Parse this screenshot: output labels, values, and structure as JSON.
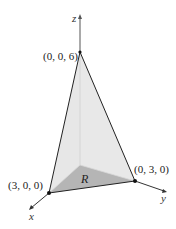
{
  "diagram": {
    "type": "3d-tetrahedron",
    "axes": {
      "x": {
        "label": "x"
      },
      "y": {
        "label": "y"
      },
      "z": {
        "label": "z"
      }
    },
    "vertices": {
      "apex": {
        "label": "(0, 0, 6)"
      },
      "x_intercept": {
        "label": "(3, 0, 0)"
      },
      "y_intercept": {
        "label": "(0, 3, 0)"
      }
    },
    "region": {
      "label": "R"
    },
    "colors": {
      "front_face": "#e6e6e6",
      "side_face": "#f1f1f1",
      "base_region": "#b4b4b4",
      "lines": "#222222"
    }
  }
}
